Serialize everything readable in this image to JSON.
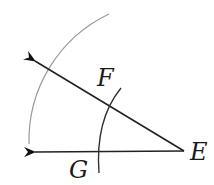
{
  "diagram": {
    "colors": {
      "ray": "#222222",
      "construction_arc_large": "#9a9a9a",
      "construction_arc_small": "#333333",
      "label": "#1a1a1a"
    },
    "vertex": {
      "label": "E",
      "x": 184,
      "y": 151
    },
    "rays": [
      {
        "name": "upper-ray",
        "from": [
          184,
          151
        ],
        "to": [
          33,
          60
        ]
      },
      {
        "name": "lower-ray",
        "from": [
          184,
          151
        ],
        "to": [
          33,
          152
        ]
      }
    ],
    "points": [
      {
        "label": "F",
        "x": 108,
        "y": 106
      },
      {
        "label": "G",
        "x": 96,
        "y": 152
      }
    ],
    "labels": {
      "E": "E",
      "F": "F",
      "G": "G"
    }
  }
}
